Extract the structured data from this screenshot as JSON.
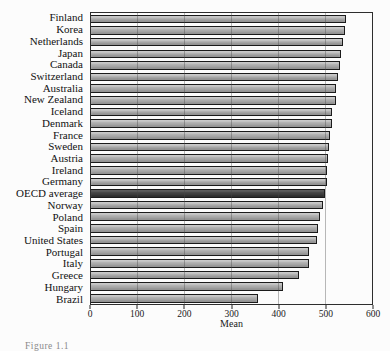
{
  "page": {
    "caption_fragment": "Figure 1.1"
  },
  "chart_data": {
    "type": "bar",
    "orientation": "horizontal",
    "title": "",
    "xlabel": "Mean",
    "xlim": [
      0,
      600
    ],
    "xticks": [
      0,
      100,
      200,
      300,
      400,
      500,
      600
    ],
    "grid": true,
    "legend": "none",
    "categories": [
      "Finland",
      "Korea",
      "Netherlands",
      "Japan",
      "Canada",
      "Switzerland",
      "Australia",
      "New Zealand",
      "Iceland",
      "Denmark",
      "France",
      "Sweden",
      "Austria",
      "Ireland",
      "Germany",
      "OECD average",
      "Norway",
      "Poland",
      "Spain",
      "United States",
      "Portugal",
      "Italy",
      "Greece",
      "Hungary",
      "Brazil"
    ],
    "values": [
      544,
      542,
      538,
      534,
      532,
      527,
      524,
      523,
      515,
      514,
      511,
      509,
      506,
      503,
      503,
      500,
      495,
      490,
      485,
      483,
      466,
      466,
      445,
      410,
      356
    ],
    "highlight_category": "OECD average",
    "highlight_index": 15,
    "colors": {
      "bar": "#ababab",
      "bar_highlight": "#404040",
      "bar_border": "#1b1b1b",
      "gridline": "#6e6e6e",
      "axis": "#2e2e2e",
      "background": "#fcfcfc"
    }
  }
}
